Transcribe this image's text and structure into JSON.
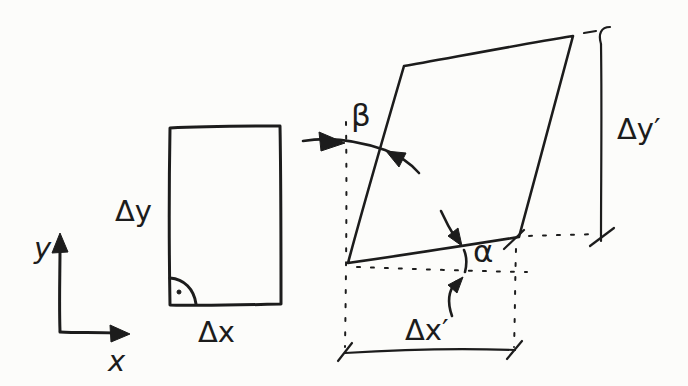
{
  "colors": {
    "background": "#fcfcfa",
    "ink": "#1c1c1c"
  },
  "axes": {
    "x_label": "x",
    "y_label": "y"
  },
  "original_rectangle": {
    "height_label": "Δy",
    "width_label": "Δx"
  },
  "deformed_parallelogram": {
    "height_label": "Δy′",
    "width_label": "Δx′",
    "alpha_label": "α",
    "beta_label": "β"
  }
}
